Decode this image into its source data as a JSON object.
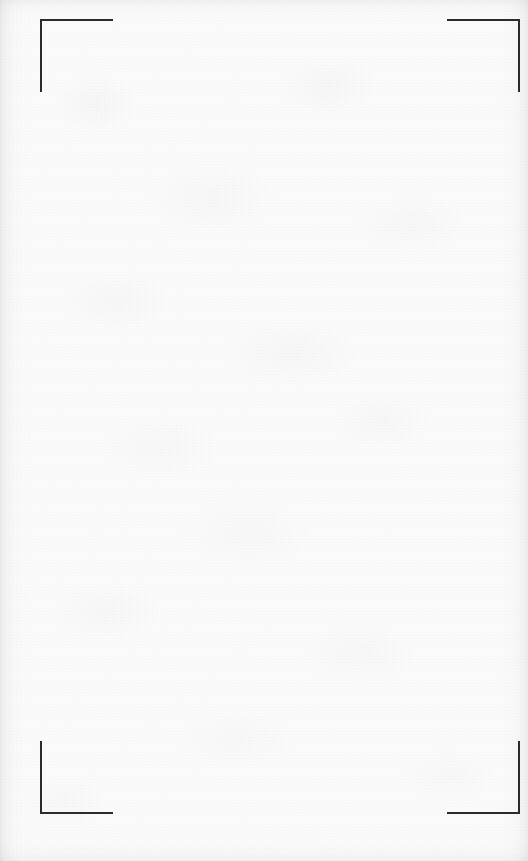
{
  "page": {
    "kind": "scanned-blank-sheet",
    "width": 528,
    "height": 861,
    "paper_color": "#fbfbfb",
    "mark_color": "#2b2b2d",
    "body_text": "",
    "content_note": ""
  },
  "crop_marks": {
    "stroke_width": 2,
    "arm_length": 73,
    "items": [
      {
        "name": "top-left",
        "corner_x": 40,
        "corner_y": 19,
        "h_dir": "right",
        "v_dir": "down"
      },
      {
        "name": "top-right",
        "corner_x": 518,
        "corner_y": 19,
        "h_dir": "left",
        "v_dir": "down"
      },
      {
        "name": "bottom-left",
        "corner_x": 40,
        "corner_y": 812,
        "h_dir": "right",
        "v_dir": "up"
      },
      {
        "name": "bottom-right",
        "corner_x": 518,
        "corner_y": 812,
        "h_dir": "left",
        "v_dir": "up"
      }
    ]
  }
}
